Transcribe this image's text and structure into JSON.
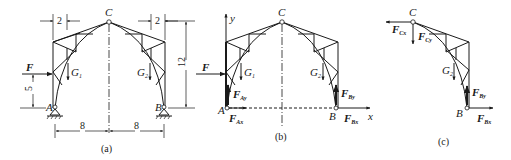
{
  "figure": {
    "panels": [
      {
        "caption": "(a)",
        "points": {
          "A": "A",
          "B": "B",
          "C": "C"
        },
        "loads": {
          "F": "F",
          "G1": "G",
          "G1_sub": "1",
          "G2": "G",
          "G2_sub": "2"
        },
        "dimensions": {
          "top_left": "2",
          "top_right": "2",
          "height_right": "12",
          "height_left": "5",
          "span_left": "8",
          "span_right": "8"
        }
      },
      {
        "caption": "(b)",
        "points": {
          "A": "A",
          "B": "B",
          "C": "C"
        },
        "axes": {
          "x": "x",
          "y": "y"
        },
        "loads": {
          "F": "F",
          "G1": "G",
          "G1_sub": "1",
          "G2": "G",
          "G2_sub": "2"
        },
        "reactions": {
          "FAy": "F",
          "FAy_sub": "Ay",
          "FAx": "F",
          "FAx_sub": "Ax",
          "FBy": "F",
          "FBy_sub": "By",
          "FBx": "F",
          "FBx_sub": "Bx"
        }
      },
      {
        "caption": "(c)",
        "points": {
          "B": "B",
          "C": "C"
        },
        "loads": {
          "G2": "G",
          "G2_sub": "2"
        },
        "reactions": {
          "FCx": "F",
          "FCx_sub": "Cx",
          "FCy": "F",
          "FCy_sub": "Cy",
          "FBy": "F",
          "FBy_sub": "By",
          "FBx": "F",
          "FBx_sub": "Bx"
        }
      }
    ]
  }
}
